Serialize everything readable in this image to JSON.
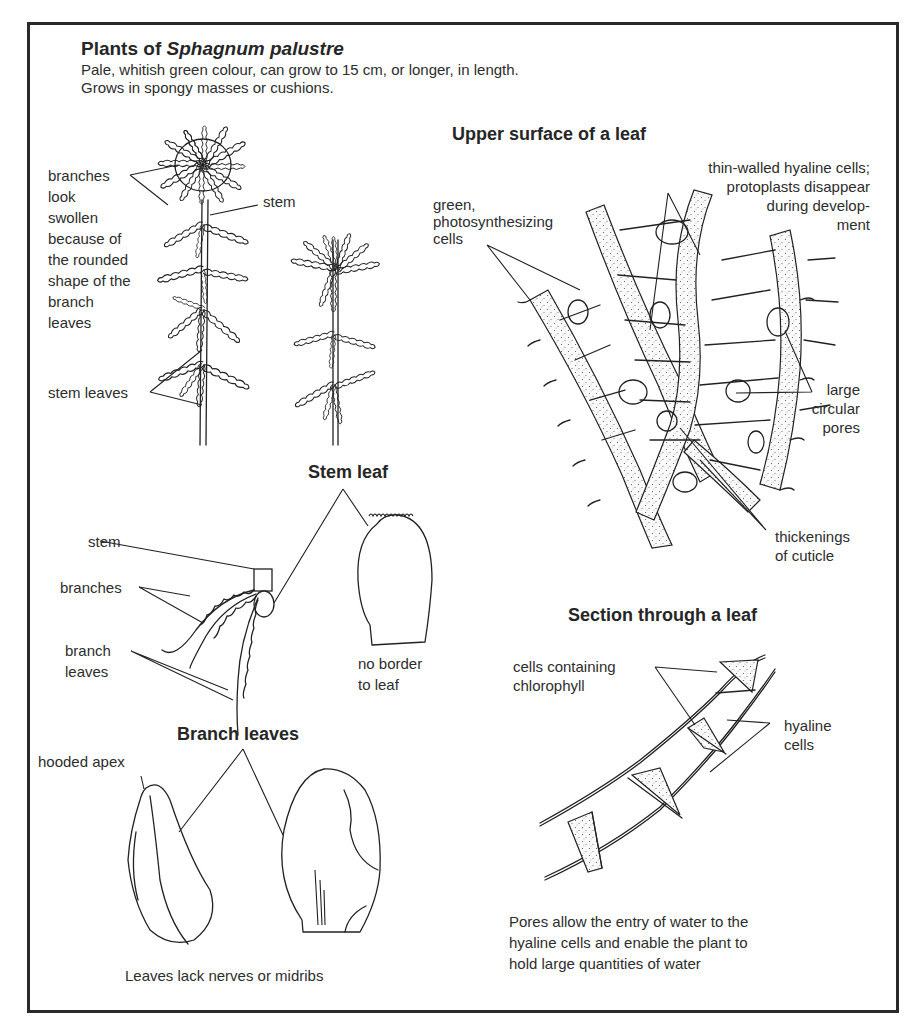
{
  "header": {
    "title_prefix": "Plants of ",
    "title_species": "Sphagnum palustre",
    "description_line1": "Pale, whitish green colour, can grow to 15 cm, or longer, in length.",
    "description_line2": "Grows in spongy masses or cushions."
  },
  "plants_panel": {
    "labels": {
      "branches": "branches\nlook\nswollen\nbecause of\nthe rounded\nshape of the\nbranch\nleaves",
      "stem": "stem",
      "stem_leaves": "stem leaves"
    }
  },
  "upper_surface_panel": {
    "heading": "Upper surface of a leaf",
    "labels": {
      "hyaline": "thin-walled hyaline cells;\nprotoplasts disappear\nduring develop-\nment",
      "green_cells": "green,\nphotosynthesizing\ncells",
      "pores": "large\ncircular\npores",
      "thickenings": "thickenings\nof cuticle"
    }
  },
  "stem_leaf_panel": {
    "heading": "Stem leaf",
    "labels": {
      "stem": "stem",
      "branches": "branches",
      "branch_leaves": "branch\nleaves",
      "no_border": "no border\nto leaf"
    }
  },
  "section_panel": {
    "heading": "Section through a leaf",
    "labels": {
      "chlorophyll_cells": "cells containing\nchlorophyll",
      "hyaline_cells": "hyaline\ncells"
    },
    "caption": "Pores allow the entry of water to the\nhyaline cells and enable the plant to\nhold large quantities of water"
  },
  "branch_leaves_panel": {
    "heading": "Branch leaves",
    "labels": {
      "hooded_apex": "hooded apex"
    },
    "caption": "Leaves lack nerves or midribs"
  },
  "colors": {
    "ink": "#222222",
    "paper": "#ffffff"
  }
}
